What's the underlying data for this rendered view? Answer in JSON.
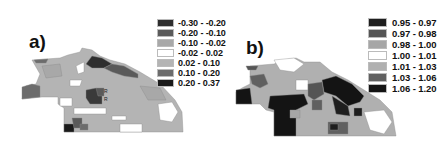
{
  "figure": {
    "panels": [
      {
        "label": "a)",
        "legend": [
          {
            "range": "-0.30 - -0.20",
            "color": "#2e2e2e"
          },
          {
            "range": "-0.20 - -0.10",
            "color": "#5a5a5a"
          },
          {
            "range": "-0.10 - -0.02",
            "color": "#a8a8a8"
          },
          {
            "range": "-0.02 - 0.02",
            "color": "#ffffff"
          },
          {
            "range": "0.02 - 0.10",
            "color": "#b4b4b4"
          },
          {
            "range": "0.10 - 0.20",
            "color": "#6c6c6c"
          },
          {
            "range": "0.20 - 0.37",
            "color": "#1a1a1a"
          }
        ],
        "map_markers": [
          "R",
          "R"
        ]
      },
      {
        "label": "b)",
        "legend": [
          {
            "range": "0.95 - 0.97",
            "color": "#1e1e1e"
          },
          {
            "range": "0.97 - 0.98",
            "color": "#555555"
          },
          {
            "range": "0.98 - 1.00",
            "color": "#a6a6a6"
          },
          {
            "range": "1.00 - 1.01",
            "color": "#ffffff"
          },
          {
            "range": "1.01 - 1.03",
            "color": "#b0b0b0"
          },
          {
            "range": "1.03 - 1.06",
            "color": "#606060"
          },
          {
            "range": "1.06 - 1.20",
            "color": "#141414"
          }
        ]
      }
    ]
  }
}
